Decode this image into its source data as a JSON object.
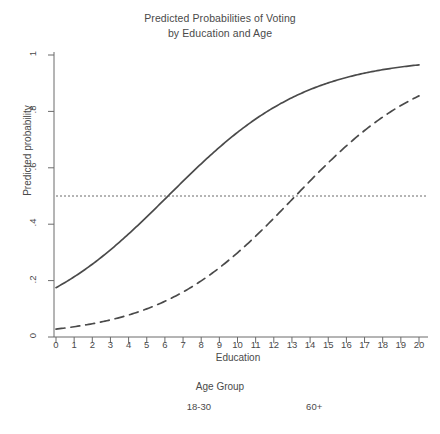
{
  "chart_data": {
    "type": "line",
    "title": "Predicted Probabilities of Voting by Education and Age",
    "title_lines": [
      "Predicted Probabilities of Voting",
      "by Education and Age"
    ],
    "xlabel": "Education",
    "ylabel": "Predicted probability",
    "xlim": [
      0,
      20
    ],
    "ylim": [
      0,
      1
    ],
    "grid": false,
    "legend_position": "bottom",
    "legend_title": "Age Group",
    "x": [
      0,
      1,
      2,
      3,
      4,
      5,
      6,
      7,
      8,
      9,
      10,
      11,
      12,
      13,
      14,
      15,
      16,
      17,
      18,
      19,
      20
    ],
    "xticks": [
      "0",
      "1",
      "2",
      "3",
      "4",
      "5",
      "6",
      "7",
      "8",
      "9",
      "10",
      "11",
      "12",
      "13",
      "14",
      "15",
      "16",
      "17",
      "18",
      "19",
      "20"
    ],
    "yticks": [
      "0",
      ".2",
      ".4",
      ".6",
      ".8",
      "1"
    ],
    "ytick_values": [
      0,
      0.2,
      0.4,
      0.6,
      0.8,
      1
    ],
    "reference_line": {
      "label": "0.5 probability threshold",
      "y": 0.5,
      "style": "dotted"
    },
    "series": [
      {
        "name": "18-30",
        "style": "dashed",
        "color": "#4a4a4a",
        "midpoint": 13.1,
        "slope": 0.27,
        "values": [
          0.028,
          0.036,
          0.047,
          0.061,
          0.079,
          0.101,
          0.129,
          0.164,
          0.206,
          0.255,
          0.312,
          0.376,
          0.444,
          0.513,
          0.582,
          0.647,
          0.706,
          0.758,
          0.802,
          0.839,
          0.855
        ]
      },
      {
        "name": "60+",
        "style": "solid",
        "color": "#4a4a4a",
        "midpoint": 6.2,
        "slope": 0.26,
        "values": [
          0.175,
          0.216,
          0.264,
          0.318,
          0.378,
          0.441,
          0.506,
          0.57,
          0.632,
          0.689,
          0.74,
          0.785,
          0.823,
          0.855,
          0.882,
          0.903,
          0.921,
          0.936,
          0.947,
          0.957,
          0.965
        ]
      }
    ]
  },
  "axes": {
    "x_axis_name": "education-axis",
    "y_axis_name": "predicted-probability-axis"
  }
}
